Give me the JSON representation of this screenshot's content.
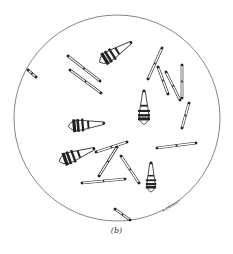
{
  "figure": {
    "caption": "(b)",
    "signature": "A. ZAGRAN F",
    "stroke_color": "#222222",
    "field": {
      "cx": 117,
      "cy": 118,
      "r": 103
    },
    "rods": [
      {
        "x1": 28,
        "y1": 70,
        "x2": 36,
        "y2": 77
      },
      {
        "x1": 68,
        "y1": 56,
        "x2": 100,
        "y2": 81
      },
      {
        "x1": 70,
        "y1": 70,
        "x2": 101,
        "y2": 93
      },
      {
        "x1": 162,
        "y1": 48,
        "x2": 148,
        "y2": 79
      },
      {
        "x1": 158,
        "y1": 67,
        "x2": 168,
        "y2": 94
      },
      {
        "x1": 166,
        "y1": 72,
        "x2": 180,
        "y2": 100
      },
      {
        "x1": 182,
        "y1": 65,
        "x2": 182,
        "y2": 98
      },
      {
        "x1": 189,
        "y1": 103,
        "x2": 182,
        "y2": 128
      },
      {
        "x1": 127,
        "y1": 142,
        "x2": 96,
        "y2": 152
      },
      {
        "x1": 117,
        "y1": 147,
        "x2": 99,
        "y2": 176
      },
      {
        "x1": 121,
        "y1": 156,
        "x2": 139,
        "y2": 183
      },
      {
        "x1": 157,
        "y1": 148,
        "x2": 196,
        "y2": 143
      },
      {
        "x1": 82,
        "y1": 183,
        "x2": 125,
        "y2": 179
      },
      {
        "x1": 115,
        "y1": 209,
        "x2": 130,
        "y2": 220
      }
    ],
    "clubs": [
      {
        "x": 103,
        "y": 60,
        "angle": -32,
        "len": 33
      },
      {
        "x": 72,
        "y": 126,
        "angle": -5,
        "len": 32
      },
      {
        "x": 63,
        "y": 160,
        "angle": -20,
        "len": 33
      },
      {
        "x": 144,
        "y": 121,
        "angle": -90,
        "len": 30
      },
      {
        "x": 151,
        "y": 189,
        "angle": -90,
        "len": 26
      }
    ]
  }
}
